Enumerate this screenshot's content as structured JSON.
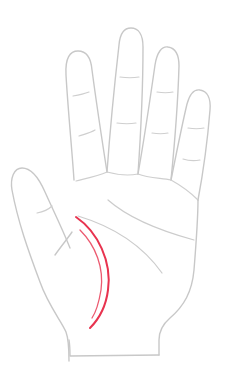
{
  "diagram": {
    "highlighted_feature": "life line with sister line",
    "colors": {
      "background": "#ffffff",
      "outline": "#c8c8c8",
      "crease": "#cfcfcf",
      "highlight": "#e8334f",
      "highlight_secondary": "#ec5a70"
    },
    "elements": [
      {
        "name": "thumb",
        "type": "outline"
      },
      {
        "name": "index-finger",
        "type": "outline"
      },
      {
        "name": "middle-finger",
        "type": "outline"
      },
      {
        "name": "ring-finger",
        "type": "outline"
      },
      {
        "name": "little-finger",
        "type": "outline"
      },
      {
        "name": "palm",
        "type": "outline"
      },
      {
        "name": "wrist",
        "type": "outline"
      },
      {
        "name": "heart-line",
        "type": "palm-line"
      },
      {
        "name": "head-line",
        "type": "palm-line"
      },
      {
        "name": "life-line",
        "type": "highlighted"
      },
      {
        "name": "sister-line",
        "type": "highlighted"
      }
    ]
  }
}
